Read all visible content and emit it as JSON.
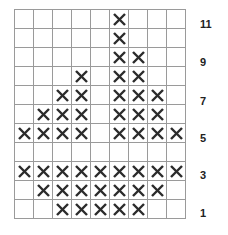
{
  "diagram": {
    "columns": 9,
    "rows": 11,
    "mark_color": "#2b2b2b",
    "grid_color": "#9a9a9a",
    "cells": [
      [
        0,
        0,
        0,
        0,
        0,
        1,
        0,
        0,
        0
      ],
      [
        0,
        0,
        0,
        0,
        0,
        1,
        0,
        0,
        0
      ],
      [
        0,
        0,
        0,
        0,
        0,
        1,
        1,
        0,
        0
      ],
      [
        0,
        0,
        0,
        1,
        0,
        1,
        1,
        0,
        0
      ],
      [
        0,
        0,
        1,
        1,
        0,
        1,
        1,
        1,
        0
      ],
      [
        0,
        1,
        1,
        1,
        0,
        1,
        1,
        1,
        0
      ],
      [
        1,
        1,
        1,
        1,
        0,
        1,
        1,
        1,
        1
      ],
      [
        0,
        0,
        0,
        0,
        0,
        0,
        0,
        0,
        0
      ],
      [
        1,
        1,
        1,
        1,
        1,
        1,
        1,
        1,
        1
      ],
      [
        0,
        1,
        1,
        1,
        1,
        1,
        1,
        1,
        0
      ],
      [
        0,
        0,
        1,
        1,
        1,
        1,
        1,
        0,
        0
      ]
    ],
    "row_labels": [
      {
        "text": "11",
        "top": 18
      },
      {
        "text": "9",
        "top": 56
      },
      {
        "text": "7",
        "top": 95
      },
      {
        "text": "5",
        "top": 132
      },
      {
        "text": "3",
        "top": 169
      },
      {
        "text": "1",
        "top": 207
      }
    ]
  }
}
